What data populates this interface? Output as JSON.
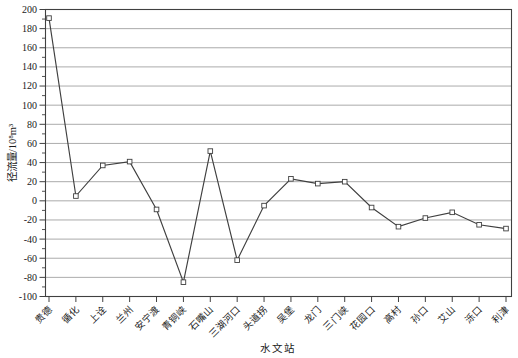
{
  "chart_data": {
    "type": "line",
    "title": "",
    "xlabel": "水文站",
    "ylabel": "径流量/10⁸m³",
    "categories": [
      "贵德",
      "循化",
      "上诠",
      "兰州",
      "安宁渡",
      "青铜峡",
      "石嘴山",
      "三湖河口",
      "头道拐",
      "吴堡",
      "龙门",
      "三门峡",
      "花园口",
      "高村",
      "孙口",
      "艾山",
      "泺口",
      "利津"
    ],
    "values": [
      191,
      5,
      37,
      41,
      -9,
      -85,
      52,
      -62,
      -5,
      23,
      18,
      20,
      -7,
      -27,
      -18,
      -12,
      -25,
      -29
    ],
    "ylim": [
      -100,
      200
    ],
    "ytick_step": 20,
    "y_minor_tick_step": 10,
    "yticks": [
      200,
      180,
      160,
      140,
      120,
      100,
      80,
      60,
      40,
      20,
      0,
      -20,
      -40,
      -60,
      -80,
      -100
    ],
    "grid": "horizontal-only",
    "legend": "none",
    "marker": "open-square",
    "colors": {
      "line": "#3f3f3f",
      "marker_fill": "#ffffff",
      "grid": "#8f8f8f",
      "border": "#404040",
      "text": "#1a1a1a",
      "background": "#ffffff"
    }
  }
}
